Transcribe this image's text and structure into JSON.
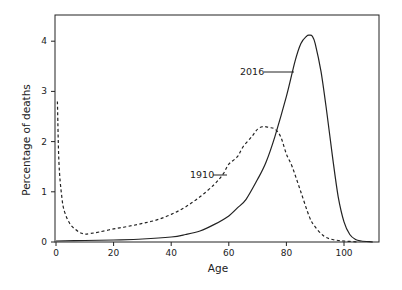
{
  "chart_data": {
    "type": "line",
    "title": "",
    "xlabel": "Age",
    "ylabel": "Percentage of deaths",
    "xlim": [
      0,
      112
    ],
    "ylim": [
      0,
      4.5
    ],
    "xticks": [
      0,
      20,
      40,
      60,
      80,
      100
    ],
    "yticks": [
      0,
      1,
      2,
      3,
      4
    ],
    "grid": false,
    "legend": "inline annotations",
    "series": [
      {
        "name": "2016",
        "style": "solid",
        "x": [
          0,
          10,
          20,
          30,
          40,
          45,
          50,
          55,
          60,
          63,
          66,
          70,
          73,
          76,
          80,
          83,
          85,
          87,
          88,
          89,
          90,
          92,
          94,
          96,
          98,
          100,
          102,
          104,
          106,
          110
        ],
        "values": [
          0.02,
          0.03,
          0.04,
          0.06,
          0.1,
          0.15,
          0.22,
          0.35,
          0.52,
          0.68,
          0.85,
          1.25,
          1.6,
          2.1,
          2.9,
          3.6,
          3.95,
          4.1,
          4.12,
          4.1,
          3.95,
          3.4,
          2.6,
          1.7,
          0.9,
          0.4,
          0.15,
          0.05,
          0.02,
          0.0
        ]
      },
      {
        "name": "1910",
        "style": "dashed",
        "x": [
          0.5,
          1,
          2,
          3,
          5,
          8,
          10,
          12,
          15,
          20,
          25,
          30,
          35,
          40,
          45,
          50,
          55,
          58,
          60,
          63,
          65,
          68,
          70,
          72,
          74,
          76,
          78,
          80,
          82,
          85,
          88,
          90,
          93,
          96,
          100,
          105
        ],
        "values": [
          2.8,
          1.6,
          0.9,
          0.6,
          0.35,
          0.2,
          0.16,
          0.17,
          0.2,
          0.26,
          0.31,
          0.37,
          0.44,
          0.55,
          0.7,
          0.9,
          1.15,
          1.35,
          1.55,
          1.7,
          1.9,
          2.1,
          2.25,
          2.3,
          2.28,
          2.25,
          2.1,
          1.75,
          1.5,
          1.0,
          0.5,
          0.3,
          0.12,
          0.05,
          0.02,
          0.0
        ]
      }
    ],
    "annotations": [
      {
        "text": "2016",
        "x_label_px": 268,
        "y_label_px": 72
      },
      {
        "text": "1910",
        "x_label_px": 189,
        "y_label_px": 175
      }
    ]
  },
  "labels": {
    "x_axis": "Age",
    "y_axis": "Percentage of deaths",
    "annotation_2016": "2016",
    "annotation_1910": "1910",
    "xtick_labels": [
      "0",
      "20",
      "40",
      "60",
      "80",
      "100"
    ],
    "ytick_labels": [
      "0",
      "1",
      "2",
      "3",
      "4"
    ]
  }
}
